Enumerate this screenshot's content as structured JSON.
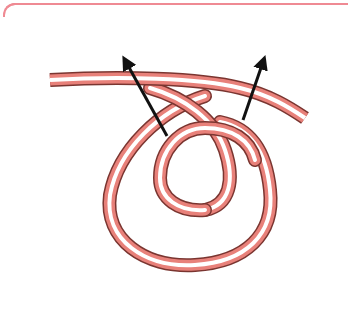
{
  "diagram": {
    "colors": {
      "frame": "#ef8a93",
      "rope_edge": "#7a3530",
      "rope_body": "#e8817a",
      "rope_highlight": "#ffffff",
      "arrow": "#111111"
    },
    "elements": [
      {
        "type": "rope",
        "name": "standing-part"
      },
      {
        "type": "rope",
        "name": "outer-loop"
      },
      {
        "type": "rope",
        "name": "inner-loop"
      },
      {
        "type": "arrow",
        "name": "left-arrow",
        "direction": "up-left"
      },
      {
        "type": "arrow",
        "name": "right-arrow",
        "direction": "up-right"
      }
    ]
  }
}
